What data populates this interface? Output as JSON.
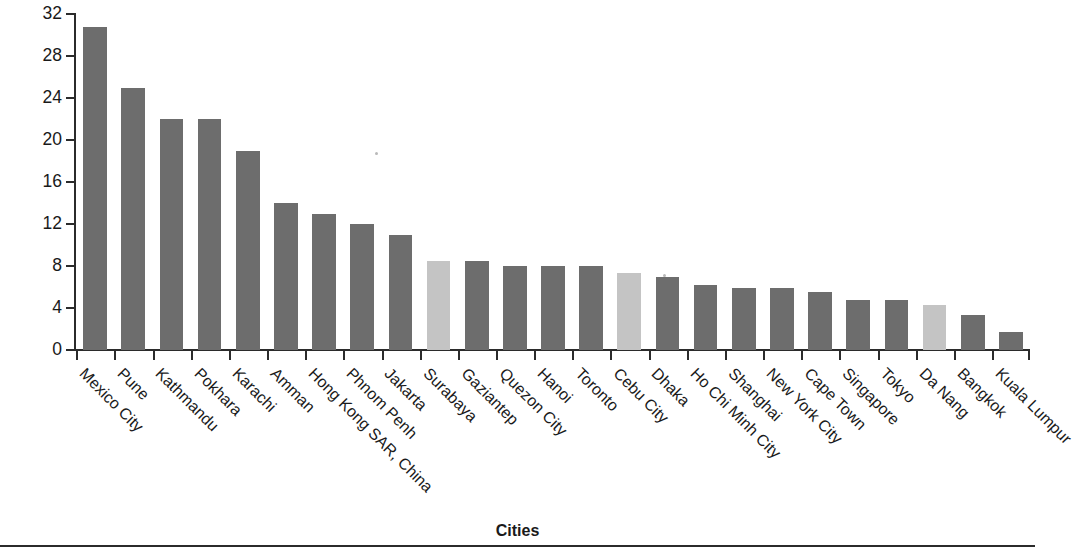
{
  "chart_data": {
    "type": "bar",
    "title": "",
    "xlabel": "Cities",
    "ylabel": "T&D loss as percentage of total",
    "ylim": [
      0,
      32
    ],
    "yticks": [
      0,
      4,
      8,
      12,
      16,
      20,
      24,
      28,
      32
    ],
    "grid": false,
    "legend": null,
    "categories": [
      "Mexico City",
      "Pune",
      "Kathmandu",
      "Pokhara",
      "Karachi",
      "Amman",
      "Hong Kong SAR, China",
      "Phnom Penh",
      "Jakarta",
      "Surabaya",
      "Gaziantep",
      "Quezon City",
      "Hanoi",
      "Toronto",
      "Cebu City",
      "Dhaka",
      "Ho Chi Minh City",
      "Shanghai",
      "New York City",
      "Cape Town",
      "Singapore",
      "Tokyo",
      "Da Nang",
      "Bangkok",
      "Kuala Lumpur"
    ],
    "values": [
      30.8,
      25.0,
      22.0,
      22.0,
      19.0,
      14.0,
      13.0,
      12.0,
      11.0,
      8.5,
      8.5,
      8.0,
      8.0,
      8.0,
      7.3,
      7.0,
      6.2,
      5.9,
      5.9,
      5.5,
      4.8,
      4.8,
      4.3,
      3.3,
      1.7
    ],
    "bar_colors": [
      "dark",
      "dark",
      "dark",
      "dark",
      "dark",
      "dark",
      "dark",
      "dark",
      "dark",
      "light",
      "dark",
      "dark",
      "dark",
      "dark",
      "light",
      "dark",
      "dark",
      "dark",
      "dark",
      "dark",
      "dark",
      "dark",
      "light",
      "dark",
      "dark"
    ],
    "colors": {
      "dark": "#6d6d6d",
      "light": "#c4c4c4",
      "axis": "#2b2b2b",
      "text": "#1a1a1a"
    }
  }
}
